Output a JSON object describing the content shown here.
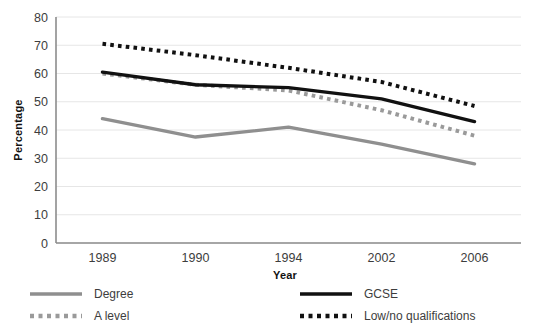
{
  "chart_data": {
    "type": "line",
    "title": "",
    "xlabel": "Year",
    "ylabel": "Percentage",
    "categories": [
      "1989",
      "1990",
      "1994",
      "2002",
      "2006"
    ],
    "x": [
      "1989",
      "1990",
      "1994",
      "2002",
      "2006"
    ],
    "ylim": [
      0,
      80
    ],
    "ytick_step": 10,
    "yticks": [
      "0",
      "10",
      "20",
      "30",
      "40",
      "50",
      "60",
      "70",
      "80"
    ],
    "grid": "horizontal",
    "legend_position": "bottom",
    "series": [
      {
        "name": "Degree",
        "color": "#8f8f8f",
        "style": "solid",
        "values": [
          44,
          37.5,
          41,
          35,
          28
        ]
      },
      {
        "name": "A level",
        "color": "#9a9a9a",
        "style": "dotted",
        "values": [
          60,
          56,
          54,
          47,
          38
        ]
      },
      {
        "name": "GCSE",
        "color": "#111111",
        "style": "solid",
        "values": [
          60.5,
          56,
          55,
          51,
          43
        ]
      },
      {
        "name": "Low/no qualifications",
        "color": "#111111",
        "style": "dotted",
        "values": [
          70.5,
          66.5,
          62,
          57,
          48.5
        ]
      }
    ]
  },
  "legend": {
    "entries": [
      {
        "label": "Degree"
      },
      {
        "label": "GCSE"
      },
      {
        "label": "A level"
      },
      {
        "label": "Low/no qualifications"
      }
    ]
  },
  "colors": {
    "grid": "#e6e6e6",
    "axis": "#8c8c8c",
    "dark_series": "#111111",
    "light_series": "#939393",
    "text": "#3d3d3d"
  }
}
